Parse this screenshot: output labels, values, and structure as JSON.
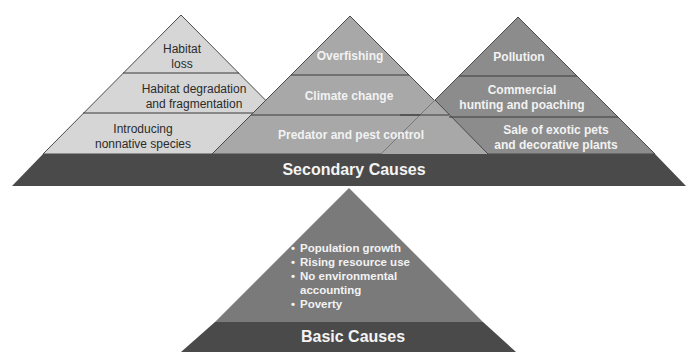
{
  "colors": {
    "background": "#ffffff",
    "left_pyramid_fill": "#d6d6d6",
    "middle_pyramid_fill": "#a8a8a8",
    "right_pyramid_fill": "#8c8c8c",
    "band_fill": "#4a4a4a",
    "basic_pyramid_fill": "#7a7a7a",
    "divider": "#3a3a3a"
  },
  "secondary_causes": {
    "band_label": "Secondary Causes",
    "pyramids": [
      {
        "id": "left",
        "layers": [
          {
            "lines": [
              "Habitat",
              "loss"
            ]
          },
          {
            "lines": [
              "Habitat degradation",
              "and fragmentation"
            ]
          },
          {
            "lines": [
              "Introducing",
              "nonnative species"
            ]
          }
        ]
      },
      {
        "id": "middle",
        "layers": [
          {
            "lines": [
              "Overfishing"
            ]
          },
          {
            "lines": [
              "Climate change"
            ]
          },
          {
            "lines": [
              "Predator and pest control"
            ]
          }
        ]
      },
      {
        "id": "right",
        "layers": [
          {
            "lines": [
              "Pollution"
            ]
          },
          {
            "lines": [
              "Commercial",
              "hunting and poaching"
            ]
          },
          {
            "lines": [
              "Sale of exotic pets",
              "and decorative plants"
            ]
          }
        ]
      }
    ]
  },
  "basic_causes": {
    "band_label": "Basic Causes",
    "items": [
      {
        "lines": [
          "Population growth"
        ]
      },
      {
        "lines": [
          "Rising resource use"
        ]
      },
      {
        "lines": [
          "No environmental",
          "accounting"
        ]
      },
      {
        "lines": [
          "Poverty"
        ]
      }
    ]
  }
}
